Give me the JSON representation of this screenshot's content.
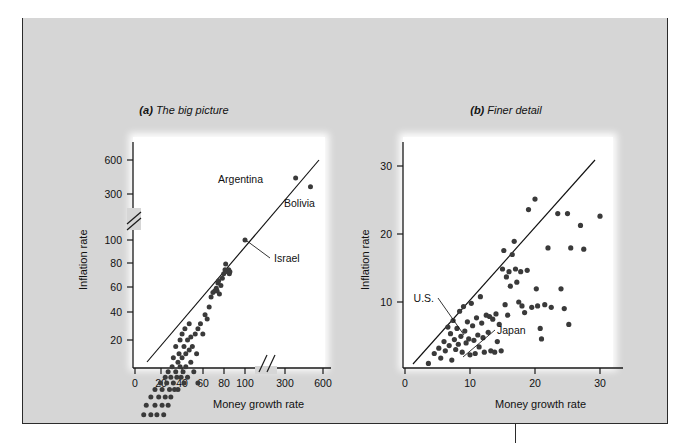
{
  "exhibit": {
    "header_label": "EXHIBIT 8",
    "subtitle": "Annual Inflation and Money Growth in 85 Countries: 1980–1990 (average annual percent)"
  },
  "colors": {
    "header_bar": "#7e7e7e",
    "card_background": "#d6d6d6",
    "subtitle_background": "#e8e8e8",
    "plot_background": "#ffffff",
    "border": "#2b2b2b",
    "dot": "#3a3a3a",
    "axis": "#1a1a1a"
  },
  "chart_data": [
    {
      "type": "scatter",
      "panel": "a",
      "panel_prefix": "(a)",
      "title": "The big picture",
      "xlabel": "Money growth rate",
      "ylabel": "Inflation rate",
      "xscale": "log-with-axis-break",
      "yscale": "log-with-axis-break",
      "xticks": [
        0,
        20,
        40,
        60,
        80,
        100,
        300,
        600
      ],
      "yticks": [
        20,
        40,
        60,
        80,
        100,
        300,
        600
      ],
      "x_axis_break_between": [
        100,
        300
      ],
      "y_axis_break_between": [
        100,
        300
      ],
      "grid": false,
      "legend": "none",
      "fit_line": {
        "label": "45-degree reference line",
        "from": [
          6,
          5
        ],
        "to": [
          640,
          640
        ]
      },
      "annotations": [
        {
          "text": "Argentina",
          "point": [
            320,
            400
          ]
        },
        {
          "text": "Bolivia",
          "point": [
            450,
            330
          ]
        },
        {
          "text": "Israel",
          "point": [
            100,
            100
          ]
        }
      ],
      "points": [
        [
          6,
          4
        ],
        [
          6.5,
          5
        ],
        [
          7,
          4
        ],
        [
          7.5,
          6
        ],
        [
          8,
          5
        ],
        [
          8,
          7
        ],
        [
          8.5,
          4
        ],
        [
          9,
          6
        ],
        [
          9,
          8
        ],
        [
          9.5,
          5
        ],
        [
          10,
          7
        ],
        [
          10,
          9
        ],
        [
          10.5,
          6
        ],
        [
          11,
          8
        ],
        [
          11,
          5
        ],
        [
          11.5,
          10
        ],
        [
          12,
          7
        ],
        [
          12,
          9
        ],
        [
          12.5,
          6
        ],
        [
          13,
          11
        ],
        [
          13,
          8
        ],
        [
          13.5,
          10
        ],
        [
          14,
          7
        ],
        [
          14,
          12
        ],
        [
          14.5,
          9
        ],
        [
          15,
          11
        ],
        [
          15,
          8
        ],
        [
          15.5,
          13
        ],
        [
          16,
          10
        ],
        [
          16,
          15
        ],
        [
          16.5,
          9
        ],
        [
          17,
          12
        ],
        [
          17,
          18
        ],
        [
          17.5,
          11
        ],
        [
          18,
          14
        ],
        [
          18,
          9
        ],
        [
          18.5,
          16
        ],
        [
          19,
          13
        ],
        [
          19,
          20
        ],
        [
          19.5,
          11
        ],
        [
          20,
          15
        ],
        [
          20,
          22
        ],
        [
          20.5,
          12
        ],
        [
          21,
          18
        ],
        [
          21,
          10
        ],
        [
          21.5,
          24
        ],
        [
          22,
          16
        ],
        [
          22,
          13
        ],
        [
          23,
          20
        ],
        [
          23,
          11
        ],
        [
          24,
          17
        ],
        [
          24,
          26
        ],
        [
          25,
          14
        ],
        [
          25,
          21
        ],
        [
          26,
          18
        ],
        [
          27,
          12
        ],
        [
          28,
          22
        ],
        [
          29,
          16
        ],
        [
          30,
          24
        ],
        [
          30,
          10
        ],
        [
          32,
          26
        ],
        [
          34,
          22
        ],
        [
          36,
          30
        ],
        [
          38,
          28
        ],
        [
          40,
          34
        ],
        [
          42,
          40
        ],
        [
          44,
          43
        ],
        [
          46,
          44
        ],
        [
          48,
          46
        ],
        [
          49,
          44
        ],
        [
          50,
          50
        ],
        [
          51,
          52
        ],
        [
          52,
          42
        ],
        [
          54,
          48
        ],
        [
          56,
          54
        ],
        [
          58,
          58
        ],
        [
          60,
          62
        ],
        [
          61,
          68
        ],
        [
          64,
          60
        ],
        [
          66,
          62
        ],
        [
          67,
          58
        ],
        [
          68,
          60
        ],
        [
          100,
          100
        ],
        [
          320,
          400
        ],
        [
          450,
          330
        ]
      ]
    },
    {
      "type": "scatter",
      "panel": "b",
      "panel_prefix": "(b)",
      "title": "Finer detail",
      "xlabel": "Money growth rate",
      "ylabel": "Inflation rate",
      "xscale": "linear",
      "yscale": "linear",
      "xticks": [
        0,
        10,
        20,
        30
      ],
      "yticks": [
        10,
        20,
        30
      ],
      "xlim": [
        0,
        34
      ],
      "ylim": [
        0,
        33
      ],
      "grid": false,
      "legend": "none",
      "fit_line": {
        "label": "45-degree reference line",
        "from": [
          1.5,
          0.6
        ],
        "to": [
          29.5,
          30.5
        ]
      },
      "annotations": [
        {
          "text": "U.S.",
          "point": [
            6.6,
            6.2
          ]
        },
        {
          "text": "Japan",
          "point": [
            10.2,
            2.2
          ]
        }
      ],
      "points": [
        [
          3.6,
          0.7
        ],
        [
          4.5,
          2.2
        ],
        [
          5.2,
          3.0
        ],
        [
          5.5,
          1.5
        ],
        [
          6.0,
          4.0
        ],
        [
          6.2,
          2.6
        ],
        [
          6.6,
          6.2
        ],
        [
          6.8,
          3.4
        ],
        [
          7.0,
          5.2
        ],
        [
          7.2,
          1.2
        ],
        [
          7.4,
          7.2
        ],
        [
          7.6,
          4.3
        ],
        [
          7.8,
          2.8
        ],
        [
          8.0,
          6.0
        ],
        [
          8.2,
          3.6
        ],
        [
          8.4,
          8.6
        ],
        [
          8.6,
          4.8
        ],
        [
          8.8,
          2.4
        ],
        [
          9.0,
          9.3
        ],
        [
          9.2,
          5.6
        ],
        [
          9.4,
          3.8
        ],
        [
          9.6,
          7.0
        ],
        [
          9.8,
          4.4
        ],
        [
          10.0,
          2.0
        ],
        [
          10.2,
          9.8
        ],
        [
          10.4,
          6.4
        ],
        [
          10.6,
          4.2
        ],
        [
          10.8,
          2.2
        ],
        [
          11.0,
          7.6
        ],
        [
          11.2,
          5.0
        ],
        [
          11.4,
          3.2
        ],
        [
          11.6,
          10.8
        ],
        [
          11.8,
          6.8
        ],
        [
          12.0,
          4.6
        ],
        [
          12.2,
          2.4
        ],
        [
          12.5,
          8.0
        ],
        [
          12.8,
          5.4
        ],
        [
          13.0,
          7.8
        ],
        [
          13.2,
          2.6
        ],
        [
          13.5,
          7.4
        ],
        [
          13.8,
          2.4
        ],
        [
          14.0,
          8.2
        ],
        [
          14.2,
          4.0
        ],
        [
          14.5,
          6.6
        ],
        [
          14.8,
          2.6
        ],
        [
          15.0,
          15.0
        ],
        [
          15.2,
          17.8
        ],
        [
          15.4,
          9.6
        ],
        [
          15.6,
          13.8
        ],
        [
          15.8,
          8.0
        ],
        [
          16.0,
          14.6
        ],
        [
          16.2,
          12.4
        ],
        [
          16.5,
          17.2
        ],
        [
          16.8,
          19.2
        ],
        [
          17.0,
          15.0
        ],
        [
          17.2,
          13.0
        ],
        [
          17.5,
          10.0
        ],
        [
          17.8,
          14.6
        ],
        [
          18.0,
          9.4
        ],
        [
          18.4,
          8.4
        ],
        [
          18.8,
          14.8
        ],
        [
          19.0,
          24.0
        ],
        [
          19.5,
          9.2
        ],
        [
          20.0,
          25.6
        ],
        [
          20.2,
          12.0
        ],
        [
          20.4,
          9.4
        ],
        [
          20.8,
          6.0
        ],
        [
          21.0,
          4.4
        ],
        [
          21.5,
          9.6
        ],
        [
          22.0,
          18.2
        ],
        [
          22.5,
          9.2
        ],
        [
          23.5,
          23.4
        ],
        [
          24.0,
          12.0
        ],
        [
          24.5,
          9.0
        ],
        [
          25.0,
          23.4
        ],
        [
          25.2,
          6.6
        ],
        [
          25.5,
          18.2
        ],
        [
          27.0,
          21.6
        ],
        [
          27.5,
          18.0
        ],
        [
          30.0,
          23.0
        ]
      ]
    }
  ]
}
